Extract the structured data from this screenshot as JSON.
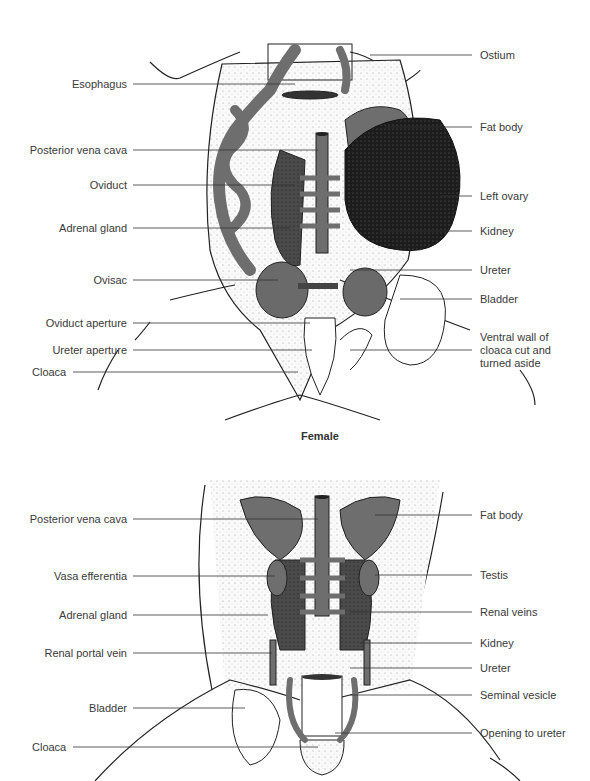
{
  "female": {
    "caption": "Female",
    "labels_left": [
      {
        "text": "Esophagus",
        "y": 84
      },
      {
        "text": "Posterior vena cava",
        "y": 150
      },
      {
        "text": "Oviduct",
        "y": 185
      },
      {
        "text": "Adrenal gland",
        "y": 228
      },
      {
        "text": "Ovisac",
        "y": 280
      },
      {
        "text": "Oviduct aperture",
        "y": 323
      },
      {
        "text": "Ureter aperture",
        "y": 350
      },
      {
        "text": "Cloaca",
        "y": 372
      }
    ],
    "labels_right": [
      {
        "text": "Ostium",
        "y": 55
      },
      {
        "text": "Fat body",
        "y": 127
      },
      {
        "text": "Left ovary",
        "y": 196
      },
      {
        "text": "Kidney",
        "y": 231
      },
      {
        "text": "Ureter",
        "y": 270
      },
      {
        "text": "Bladder",
        "y": 299
      },
      {
        "text": "Ventral wall of cloaca cut and turned aside",
        "y": 338
      }
    ]
  },
  "male": {
    "labels_left": [
      {
        "text": "Posterior vena cava",
        "y": 519
      },
      {
        "text": "Vasa efferentia",
        "y": 576
      },
      {
        "text": "Adrenal gland",
        "y": 615
      },
      {
        "text": "Renal portal vein",
        "y": 653
      },
      {
        "text": "Bladder",
        "y": 708
      },
      {
        "text": "Cloaca",
        "y": 747
      }
    ],
    "labels_right": [
      {
        "text": "Fat body",
        "y": 515
      },
      {
        "text": "Testis",
        "y": 575
      },
      {
        "text": "Renal veins",
        "y": 612
      },
      {
        "text": "Kidney",
        "y": 643
      },
      {
        "text": "Ureter",
        "y": 668
      },
      {
        "text": "Seminal vesicle",
        "y": 695
      },
      {
        "text": "Opening to ureter",
        "y": 733
      }
    ]
  },
  "colors": {
    "organ_gray": "#6e6e6e",
    "organ_dark": "#1e1e1e",
    "kidney_stipple": "#3c3c3c",
    "line": "#222222",
    "stipple_bg": "#f2f2f2"
  }
}
